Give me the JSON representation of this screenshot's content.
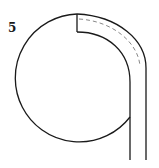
{
  "diagram": {
    "step_number": "5",
    "colors": {
      "line": "#1a1a1a",
      "dashed_line": "#888888",
      "background": "#ffffff"
    }
  }
}
